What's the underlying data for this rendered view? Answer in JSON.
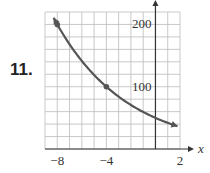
{
  "problem_number": "11.",
  "chart_data": {
    "type": "line",
    "title": "",
    "xlabel": "x",
    "ylabel": "",
    "xlim": [
      -9,
      2
    ],
    "ylim": [
      0,
      220
    ],
    "x_grid_step": 1,
    "y_grid_step": 20,
    "grid": true,
    "x_tick_labels": [
      "-8",
      "-4",
      "2"
    ],
    "y_tick_labels": [
      "100",
      "200"
    ],
    "series": [
      {
        "name": "exponential decay",
        "color": "#555555",
        "x": [
          -8.3,
          -8,
          -6,
          -4,
          -2,
          0,
          1.8
        ],
        "y": [
          215,
          200,
          142,
          100,
          71,
          50,
          37
        ],
        "marked_points": [
          {
            "x": -8,
            "y": 200
          },
          {
            "x": -4,
            "y": 100
          }
        ],
        "arrows_both_ends": true
      }
    ]
  }
}
